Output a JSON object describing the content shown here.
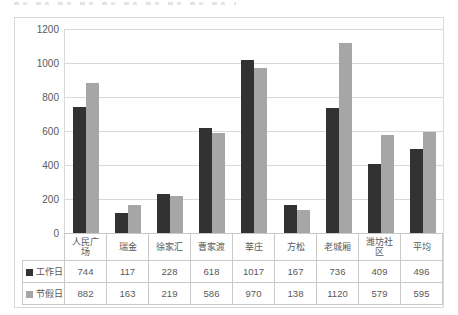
{
  "page": {
    "background": "#ffffff"
  },
  "chart_style": {
    "frame_border_color": "#d9d9d9",
    "grid_color": "#d9d9d9",
    "axis_text_color": "#595959",
    "table_border_color": "#c9c9c9",
    "table_text_color": "#595959"
  },
  "chart_data": {
    "type": "bar",
    "title": "",
    "xlabel": "",
    "ylabel": "",
    "categories": [
      "人民广场",
      "瑞金",
      "徐家汇",
      "曹家渡",
      "莘庄",
      "方松",
      "老城厢",
      "潍坊社区",
      "平均"
    ],
    "series": [
      {
        "name": "工作日",
        "color": "#323232",
        "values": [
          744,
          117,
          228,
          618,
          1017,
          167,
          736,
          409,
          496
        ]
      },
      {
        "name": "节假日",
        "color": "#a6a6a6",
        "values": [
          882,
          163,
          219,
          586,
          970,
          138,
          1120,
          579,
          595
        ]
      }
    ],
    "ylim": [
      0,
      1200
    ],
    "yticks": [
      0,
      200,
      400,
      600,
      800,
      1000,
      1200
    ],
    "grid": true,
    "legend_position": "data-table-left",
    "data_table_shown": true
  }
}
